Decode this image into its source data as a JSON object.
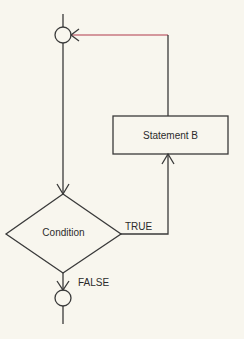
{
  "diagram": {
    "type": "flowchart",
    "colors": {
      "background": "#f8f6ee",
      "stroke": "#3a3a3a",
      "loop_back": "#b0384a",
      "text": "#2b2b2b"
    },
    "nodes": {
      "entry_junction": {
        "shape": "circle",
        "label": ""
      },
      "statement_b": {
        "shape": "rectangle",
        "label": "Statement B"
      },
      "condition": {
        "shape": "diamond",
        "label": "Condition"
      },
      "exit_junction": {
        "shape": "circle",
        "label": ""
      }
    },
    "edges": {
      "true_label": "TRUE",
      "false_label": "FALSE"
    }
  }
}
